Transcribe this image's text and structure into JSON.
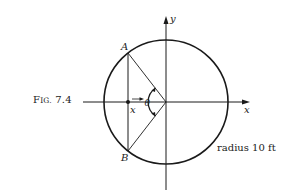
{
  "figure": {
    "caption_prefix": "F",
    "caption_smallcaps": "IG.",
    "caption_number": "7.4",
    "radius_note": "radius 10 ft"
  },
  "labels": {
    "point_a": "A",
    "point_b": "B",
    "axis_x": "x",
    "axis_y": "y",
    "position_x": "x",
    "angle": "θ"
  },
  "geometry": {
    "shape": "circle",
    "radius_ft": 10,
    "elements": [
      "x-axis",
      "y-axis",
      "vertical chord AB",
      "radius to A",
      "radius to B",
      "angle arc θ",
      "point at (x,0)",
      "direction arrow"
    ]
  },
  "colors": {
    "stroke": "#1a1a1a",
    "text": "#222222",
    "background": "#ffffff"
  }
}
